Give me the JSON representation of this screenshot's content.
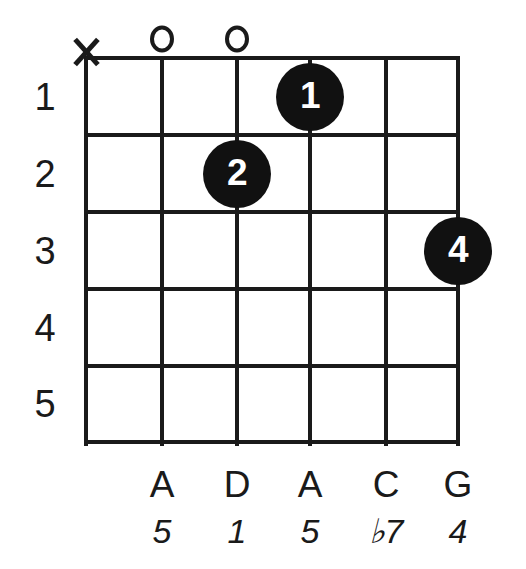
{
  "diagram": {
    "type": "guitar-chord-diagram",
    "orientation": "vertical",
    "string_count": 6,
    "fret_count": 5,
    "fret_numbers": [
      "1",
      "2",
      "3",
      "4",
      "5"
    ],
    "geometry": {
      "string_x": [
        86,
        162,
        237,
        310,
        386,
        458
      ],
      "fret_y": [
        58,
        135,
        212,
        289,
        366,
        442
      ],
      "dot_diameter": 68,
      "line_color": "#1a1a1a",
      "dot_color": "#111111",
      "dot_text_color": "#ffffff",
      "background": "#ffffff"
    }
  },
  "open_muted_markers": [
    {
      "name": "muted-string-1",
      "symbol": "X",
      "string_index": 0
    },
    {
      "name": "open-string-2",
      "symbol": "O",
      "string_index": 1
    },
    {
      "name": "open-string-3",
      "symbol": "O",
      "string_index": 2
    }
  ],
  "finger_dots": [
    {
      "finger": "1",
      "string_index": 3,
      "fret": 1
    },
    {
      "finger": "2",
      "string_index": 2,
      "fret": 2
    },
    {
      "finger": "4",
      "string_index": 5,
      "fret": 3
    }
  ],
  "bottom_labels": {
    "note_names": [
      "",
      "A",
      "D",
      "A",
      "C",
      "G"
    ],
    "interval_names": [
      "",
      "5",
      "1",
      "5",
      "♭7",
      "4"
    ]
  },
  "chart_data": {
    "type": "table",
    "categories": [
      "String 1",
      "String 2",
      "String 3",
      "String 4",
      "String 5",
      "String 6"
    ],
    "series": [
      {
        "name": "Fret",
        "values": [
          "x",
          "0",
          "2",
          "0",
          "1",
          "3"
        ]
      },
      {
        "name": "Finger",
        "values": [
          "",
          "",
          "2",
          "",
          "1",
          "4"
        ]
      },
      {
        "name": "Note",
        "values": [
          "",
          "A",
          "D",
          "A",
          "C",
          "G"
        ]
      },
      {
        "name": "Interval",
        "values": [
          "",
          "5",
          "1",
          "5",
          "♭7",
          "4"
        ]
      }
    ],
    "xlabel": "String",
    "ylabel": "Fret",
    "ylim": [
      1,
      5
    ],
    "grid": true,
    "legend": "none"
  }
}
